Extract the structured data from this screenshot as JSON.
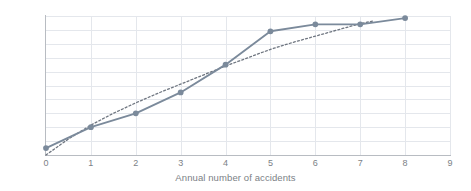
{
  "chart_data": {
    "type": "line",
    "title": "",
    "xlabel": "Annual number of accidents",
    "ylabel": "",
    "xlim": [
      0,
      9
    ],
    "ylim": [
      0,
      1
    ],
    "grid": true,
    "legend": "none",
    "x_ticks": [
      "0",
      "1",
      "2",
      "3",
      "4",
      "5",
      "6",
      "7",
      "8",
      "9"
    ],
    "y_ticks": [
      "0",
      "0,1",
      "0,2",
      "0,3",
      "0,4",
      "0,5",
      "0,6",
      "0,7",
      "0,8",
      "0,9",
      "1"
    ],
    "decimal_separator": ",",
    "series": [
      {
        "name": "empirical-cumulative",
        "style": "solid-with-markers",
        "color": "#7b8a9b",
        "marker": "circle",
        "x": [
          0,
          1,
          2,
          3,
          4,
          5,
          6,
          7,
          8
        ],
        "values": [
          0.05,
          0.2,
          0.3,
          0.45,
          0.65,
          0.89,
          0.94,
          0.94,
          0.985
        ]
      },
      {
        "name": "fitted-cumulative",
        "style": "dotted",
        "color": "#6f7680",
        "marker": "none",
        "x": [
          0,
          0.5,
          1,
          1.5,
          2,
          2.5,
          3,
          3.5,
          4,
          4.5,
          5,
          5.5,
          6,
          6.5,
          7,
          7.3
        ],
        "values": [
          0.0,
          0.115,
          0.215,
          0.3,
          0.375,
          0.445,
          0.51,
          0.575,
          0.64,
          0.7,
          0.76,
          0.81,
          0.855,
          0.9,
          0.945,
          0.965
        ]
      }
    ]
  },
  "colors": {
    "series_primary": "#7b8a9b",
    "series_secondary": "#6f7680",
    "gridline": "#e4e7ec",
    "axis": "#b8bcc2",
    "tick_label": "#7b7f86",
    "background": "#ffffff"
  }
}
